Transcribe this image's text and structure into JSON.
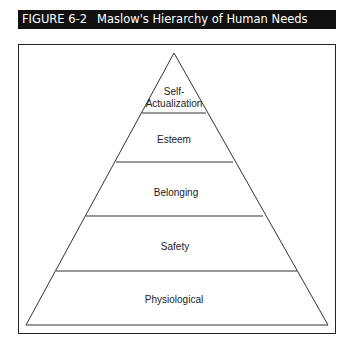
{
  "figure": {
    "number": "FIGURE 6-2",
    "title": "Maslow's Hierarchy of Human Needs"
  },
  "pyramid": {
    "levels_top_to_bottom": [
      {
        "label_line1": "Self-",
        "label_line2": "Actualization"
      },
      {
        "label": "Esteem"
      },
      {
        "label": "Belonging"
      },
      {
        "label": "Safety"
      },
      {
        "label": "Physiological"
      }
    ]
  }
}
